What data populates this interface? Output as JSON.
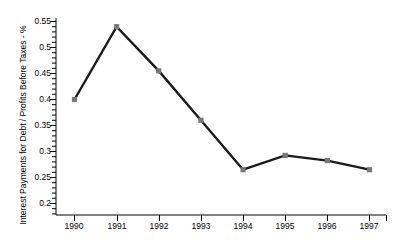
{
  "chart_data": {
    "type": "line",
    "title": "",
    "subtitle": "",
    "xlabel": "",
    "ylabel": "Interest Payments for Debt / Profits Before Taxes - %",
    "categories": [
      "1990",
      "1991",
      "1992",
      "1993",
      "1994",
      "1995",
      "1996",
      "1997"
    ],
    "x": [
      1990,
      1991,
      1992,
      1993,
      1994,
      1995,
      1996,
      1997
    ],
    "values": [
      0.4,
      0.54,
      0.455,
      0.36,
      0.265,
      0.2925,
      0.2825,
      0.265
    ],
    "series": [
      {
        "name": "Interest Payments for Debt / Profits Before Taxes - %",
        "values": [
          0.4,
          0.54,
          0.455,
          0.36,
          0.265,
          0.2925,
          0.2825,
          0.265
        ]
      }
    ],
    "ylim": [
      0.2,
      0.55
    ],
    "xlim": [
      1990,
      1997
    ],
    "ytick_labels": [
      "0.55",
      "0.5",
      "0.45",
      "0.4",
      "0.35",
      "0.3",
      "0.25",
      "0.2"
    ],
    "ytick_values": [
      0.55,
      0.5,
      0.45,
      0.4,
      0.35,
      0.3,
      0.25,
      0.2
    ],
    "ytick_minor_step": 0.01,
    "grid": false,
    "legend": "none",
    "line_color": "#1a1a1a",
    "marker_color": "#777777",
    "marker_shape": "square",
    "axis_color": "#000000",
    "background_color": "#ffffff",
    "annotations": []
  }
}
